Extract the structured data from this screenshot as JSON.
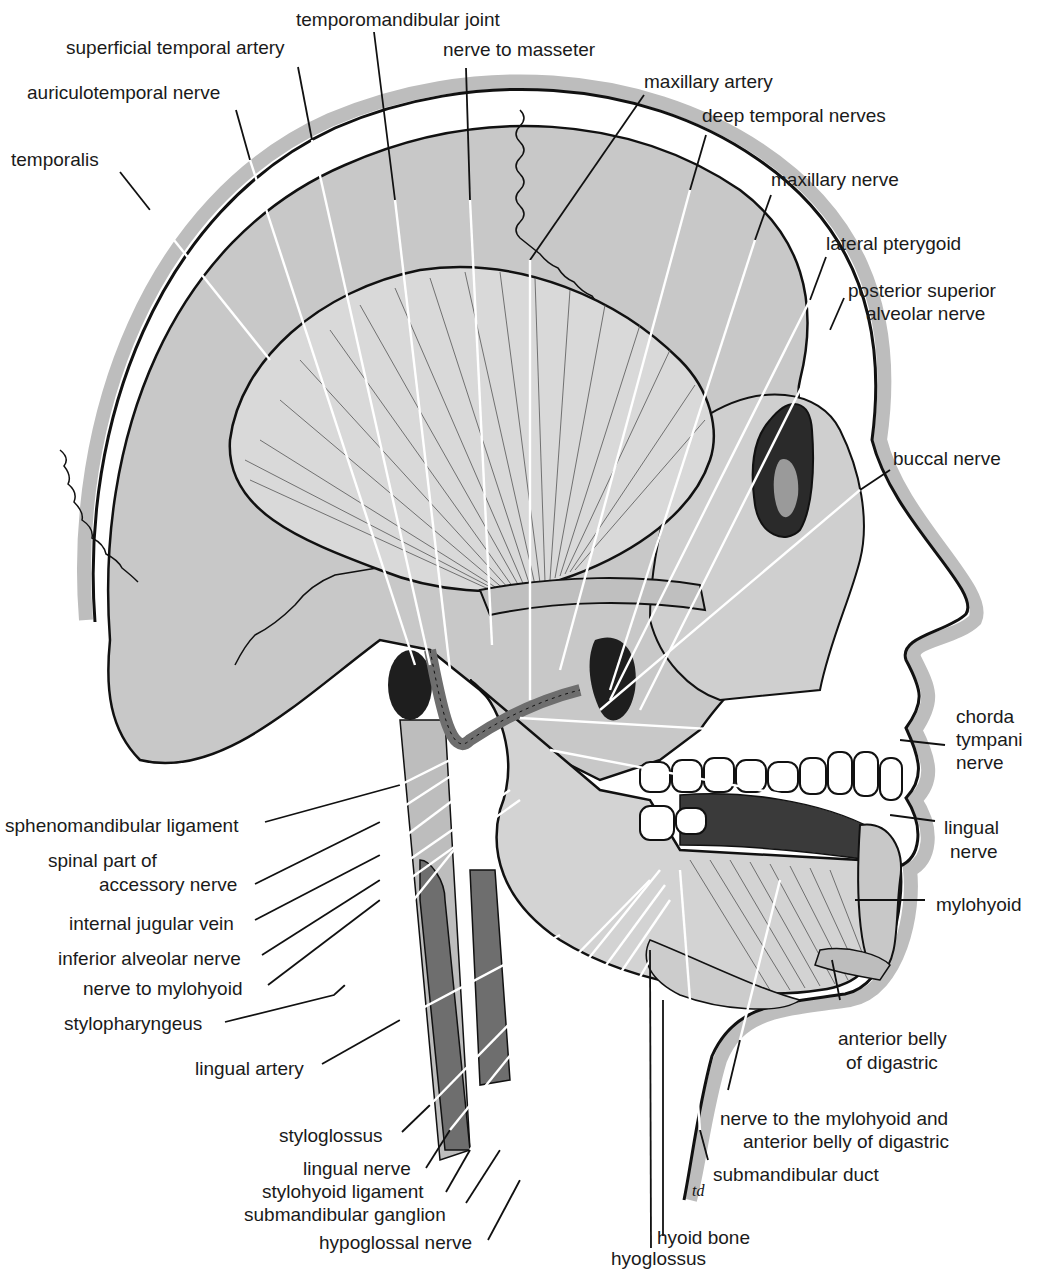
{
  "figure": {
    "type": "anatomical illustration",
    "colors": {
      "background": "#ffffff",
      "skull_fill": "#c8c8c8",
      "muscle_fill": "#d9d9d9",
      "skin_band": "#bdbdbd",
      "vessel_dark": "#6e6e6e",
      "outline": "#111111"
    },
    "artist_initials": "td"
  },
  "labels": {
    "top": [
      {
        "id": "temporomandibular-joint",
        "text": "temporomandibular joint"
      },
      {
        "id": "superficial-temporal-artery",
        "text": "superficial temporal artery"
      },
      {
        "id": "nerve-to-masseter",
        "text": "nerve to masseter"
      },
      {
        "id": "auriculotemporal-nerve",
        "text": "auriculotemporal nerve"
      },
      {
        "id": "maxillary-artery",
        "text": "maxillary artery"
      },
      {
        "id": "deep-temporal-nerves",
        "text": "deep temporal nerves"
      },
      {
        "id": "temporalis",
        "text": "temporalis"
      },
      {
        "id": "maxillary-nerve",
        "text": "maxillary nerve"
      },
      {
        "id": "lateral-pterygoid",
        "text": "lateral pterygoid"
      }
    ],
    "right": [
      {
        "id": "posterior-superior-alveolar-nerve",
        "lines": [
          "posterior superior",
          "alveolar nerve"
        ]
      },
      {
        "id": "buccal-nerve",
        "lines": [
          "buccal nerve"
        ]
      },
      {
        "id": "chorda-tympani-nerve",
        "lines": [
          "chorda",
          "tympani",
          "nerve"
        ]
      },
      {
        "id": "lingual-nerve-right",
        "lines": [
          "lingual",
          "nerve"
        ]
      },
      {
        "id": "mylohyoid",
        "lines": [
          "mylohyoid"
        ]
      },
      {
        "id": "anterior-belly-of-digastric",
        "lines": [
          "anterior belly",
          "of digastric"
        ]
      },
      {
        "id": "nerve-to-mylohyoid-and-anterior-belly",
        "lines": [
          "nerve to the mylohyoid and",
          "anterior belly of digastric"
        ]
      },
      {
        "id": "submandibular-duct",
        "lines": [
          "submandibular duct"
        ]
      }
    ],
    "left": [
      {
        "id": "sphenomandibular-ligament",
        "lines": [
          "sphenomandibular ligament"
        ]
      },
      {
        "id": "spinal-part-of-accessory-nerve",
        "lines": [
          "spinal part of",
          "accessory nerve"
        ]
      },
      {
        "id": "internal-jugular-vein",
        "lines": [
          "internal jugular vein"
        ]
      },
      {
        "id": "inferior-alveolar-nerve",
        "lines": [
          "inferior alveolar nerve"
        ]
      },
      {
        "id": "nerve-to-mylohyoid",
        "lines": [
          "nerve to mylohyoid"
        ]
      },
      {
        "id": "stylopharyngeus",
        "lines": [
          "stylopharyngeus"
        ]
      },
      {
        "id": "lingual-artery",
        "lines": [
          "lingual artery"
        ]
      }
    ],
    "bottom": [
      {
        "id": "styloglossus",
        "text": "styloglossus"
      },
      {
        "id": "lingual-nerve-bottom",
        "text": "lingual nerve"
      },
      {
        "id": "stylohyoid-ligament",
        "text": "stylohyoid ligament"
      },
      {
        "id": "submandibular-ganglion",
        "text": "submandibular ganglion"
      },
      {
        "id": "hypoglossal-nerve",
        "text": "hypoglossal nerve"
      },
      {
        "id": "hyoid-bone",
        "text": "hyoid bone"
      },
      {
        "id": "hyoglossus",
        "text": "hyoglossus"
      }
    ]
  }
}
